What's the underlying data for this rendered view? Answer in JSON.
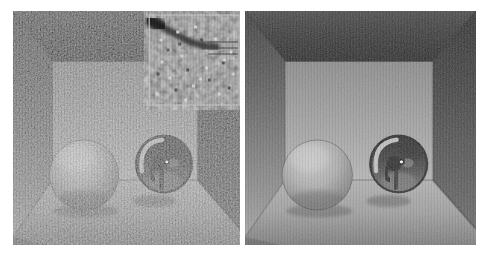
{
  "figure": {
    "type": "side-by-side render comparison",
    "panels": [
      {
        "id": "noisy-render",
        "description": "Noisy Monte Carlo path-traced grayscale render of a Cornell box containing a diffuse sphere (left) and a mirror sphere (right), with a magnified noise crop inset at the top-right corner"
      },
      {
        "id": "denoised-render",
        "description": "Converged, denoised grayscale render of the same Cornell box scene with diffuse sphere and mirror sphere"
      }
    ],
    "inset": {
      "panel": "noisy-render",
      "position": "top-right",
      "description": "Magnified crop showing Monte Carlo noise and the dark ceiling-wall edge"
    }
  },
  "colors": {
    "page_bg": "#ffffff",
    "ceiling_top": "#474747",
    "ceiling_mid": "#2c2c2c",
    "ceiling_bottom": "#181818",
    "back_wall_top": "#8e8e8e",
    "back_wall_bottom": "#b8b8b8",
    "left_wall_top": "#3c3c3c",
    "left_wall_mid": "#7a7a7a",
    "left_wall_bottom": "#a6a6a6",
    "right_wall_top": "#242424",
    "right_wall_mid": "#4f4f4f",
    "right_wall_bottom": "#6b6b6b",
    "floor_back": "#b4b4b4",
    "floor_mid": "#a2a2a2",
    "floor_front": "#7f7f7f",
    "diffuse_sphere_highlight": "#cacaca",
    "diffuse_sphere_mid": "#b2b2b2",
    "diffuse_sphere_edge": "#8a8a8a",
    "mirror_sphere_top": "#1c1c1c",
    "mirror_sphere_mid": "#3f3f3f",
    "mirror_sphere_bottom": "#828282",
    "mirror_crescent": "#cbcbcb",
    "specular_highlight": "#ffffff",
    "inset_base": "#8a8a8a",
    "inset_border": "#c4c4c4",
    "inset_band": "#1f1f1f",
    "speck_bright": "#d6d6d6",
    "speck_dark": "#454545"
  }
}
